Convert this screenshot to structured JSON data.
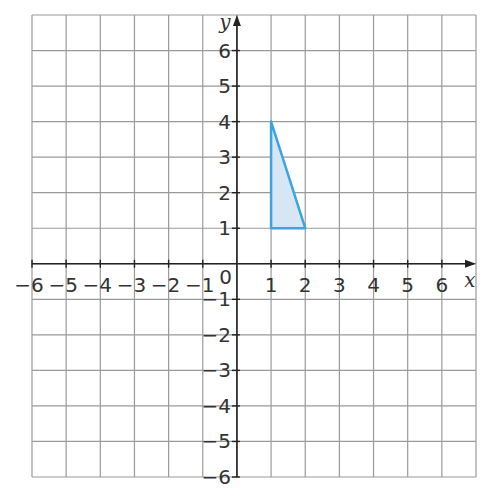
{
  "chart_data": {
    "type": "scatter",
    "title": "",
    "xlabel": "x",
    "ylabel": "y",
    "xlim": [
      -6,
      6
    ],
    "ylim": [
      -6,
      6
    ],
    "grid": true,
    "x_ticks": [
      -6,
      -5,
      -4,
      -3,
      -2,
      -1,
      1,
      2,
      3,
      4,
      5,
      6
    ],
    "y_ticks": [
      -6,
      -5,
      -4,
      -3,
      -2,
      -1,
      1,
      2,
      3,
      4,
      5,
      6
    ],
    "x_tick_labels": [
      "−6",
      "−5",
      "−4",
      "−3",
      "−2",
      "−1",
      "1",
      "2",
      "3",
      "4",
      "5",
      "6"
    ],
    "y_tick_labels": [
      "−6",
      "−5",
      "−4",
      "−3",
      "−2",
      "−1",
      "1",
      "2",
      "3",
      "4",
      "5",
      "6"
    ],
    "origin_label": "0",
    "shapes": [
      {
        "name": "triangle",
        "type": "polygon",
        "vertices": [
          [
            1,
            1
          ],
          [
            1,
            4
          ],
          [
            2,
            1
          ]
        ],
        "stroke": "#3aa6dd",
        "fill": "#d6e6f5"
      }
    ]
  },
  "colors": {
    "grid": "#9a9a9a",
    "axis": "#222222",
    "shape_stroke": "#3aa6dd",
    "shape_fill": "#d6e6f5"
  }
}
